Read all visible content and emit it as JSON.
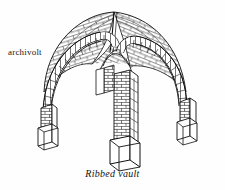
{
  "figure": {
    "caption": "Ribbed vault",
    "labels": [
      {
        "id": "archivolt",
        "text": "archivolt"
      }
    ],
    "style": {
      "background": "#fefefe",
      "ink": "#111111",
      "hatch": "#2b2b2b",
      "line_width": 0.7
    },
    "parts": [
      {
        "name": "vault-web-left",
        "description": "left groin web with coursed masonry"
      },
      {
        "name": "vault-web-right",
        "description": "right groin web with coursed masonry"
      },
      {
        "name": "diagonal-rib",
        "description": "diagonal rib crossing the crown"
      },
      {
        "name": "archivolt-rib-left",
        "description": "banded voussoir arch at left"
      },
      {
        "name": "archivolt-rib-right",
        "description": "banded voussoir arch at right"
      },
      {
        "name": "pier-left",
        "description": "left pier shaft with plinth"
      },
      {
        "name": "pier-center",
        "description": "central pier shaft with brick courses and plinth"
      },
      {
        "name": "pier-right",
        "description": "right pier shaft with plinth"
      }
    ]
  }
}
